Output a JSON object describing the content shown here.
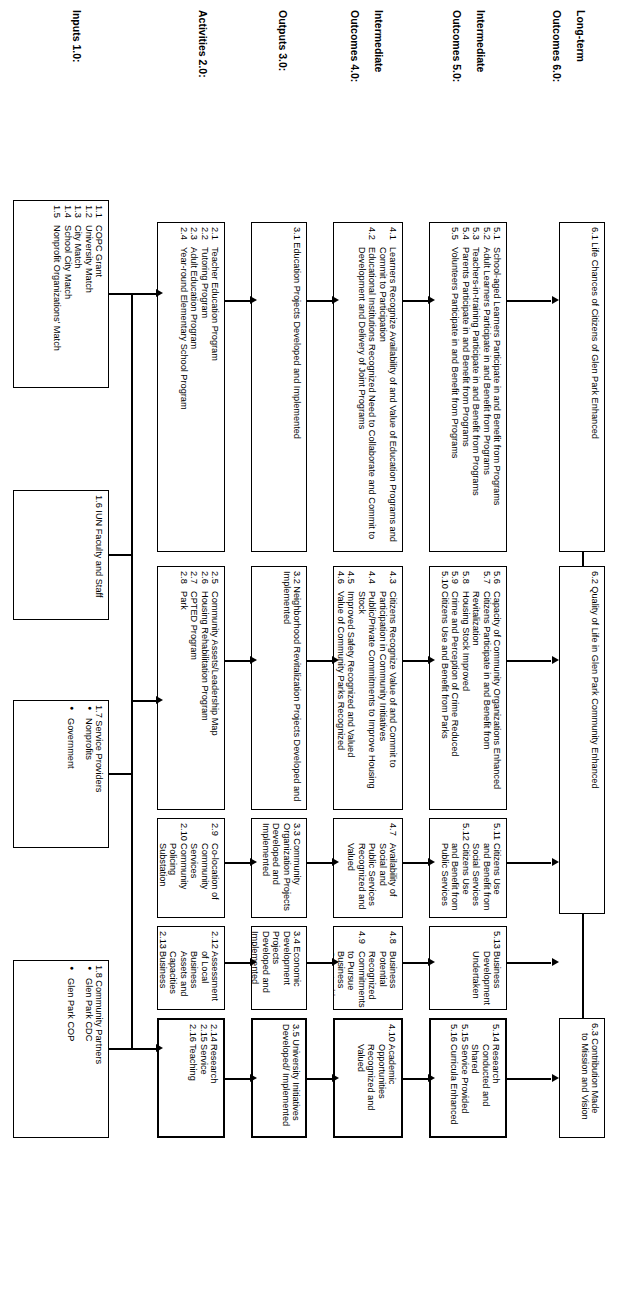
{
  "diagram": {
    "row_labels": [
      {
        "id": "long-term",
        "line1": "Long-term",
        "line2": "Outcomes 6.0:"
      },
      {
        "id": "intermediate-5",
        "line1": "Intermediate",
        "line2": "Outcomes 5.0:"
      },
      {
        "id": "intermediate-4",
        "line1": "Intermediate",
        "line2": "Outcomes 4.0:"
      },
      {
        "id": "outputs",
        "line1": "Outputs 3.0:",
        "line2": ""
      },
      {
        "id": "activities",
        "line1": "Activities 2.0:",
        "line2": ""
      },
      {
        "id": "inputs",
        "line1": "Inputs 1.0:",
        "line2": ""
      }
    ],
    "boxes": {
      "b61": {
        "title": "6.1 Life Chances of Citizens of Glen Park Enhanced"
      },
      "b62": {
        "title": "6.2 Quality of Life in Glen Park Community Enhanced"
      },
      "b63": {
        "title": "6.3 Contribution Made",
        "subtitle": "to Mission and Vision"
      },
      "b51": {
        "items": [
          {
            "num": "5.1",
            "txt": "School-aged Learners Participate in and Benefit from Programs"
          },
          {
            "num": "5.2",
            "txt": "Adult Learners Participate in and Benefit from Programs"
          },
          {
            "num": "5.3",
            "txt": "Teachers-in-training Participate in and Benefit from Programs"
          },
          {
            "num": "5.4",
            "txt": "Parents Participate in and Benefit from Programs"
          },
          {
            "num": "5.5",
            "txt": "Volunteers Participate in and Benefit from Programs"
          }
        ]
      },
      "b56": {
        "items": [
          {
            "num": "5.6",
            "txt": "Capacity of Community Organizations Enhanced"
          },
          {
            "num": "5.7",
            "txt": "Citizens Participate in and Benefit from Revitalization"
          },
          {
            "num": "5.8",
            "txt": "Housing Stock Improved"
          },
          {
            "num": "5.9",
            "txt": "Crime and Perception of Crime Reduced"
          },
          {
            "num": "5.10",
            "txt": "Citizens Use and Benefit from Parks"
          }
        ]
      },
      "b511": {
        "items": [
          {
            "num": "5.11",
            "txt": "Citizens Use and Benefit from Social Services"
          },
          {
            "num": "5.12",
            "txt": "Citizens Use and Benefit from Public Services"
          }
        ]
      },
      "b513": {
        "items": [
          {
            "num": "5.13",
            "txt": "Business Development Undertaken"
          }
        ]
      },
      "b514": {
        "items": [
          {
            "num": "5.14",
            "txt": "Research Conducted and Shared"
          },
          {
            "num": "5.15",
            "txt": "Service Provided"
          },
          {
            "num": "5.16",
            "txt": "Curricula Enhanced"
          }
        ]
      },
      "b41": {
        "items": [
          {
            "num": "4.1",
            "txt": "Learners Recognize Availability of and Value of Education Programs and Commit to Participation"
          },
          {
            "num": "4.2",
            "txt": "Educational Institutions Recognized Need to Collaborate and Commit to Development and Delivery of Joint Programs"
          }
        ]
      },
      "b43": {
        "items": [
          {
            "num": "4.3",
            "txt": "Citizens Recognize Value of and Commit to Participation in Community Initiatives"
          },
          {
            "num": "4.4",
            "txt": "Public/Private Commitments to Improve Housing Stock"
          },
          {
            "num": "4.5",
            "txt": "Improved Safety Recognized and Valued"
          },
          {
            "num": "4.6",
            "txt": "Value of Community Parks Recognized"
          }
        ]
      },
      "b47": {
        "items": [
          {
            "num": "4.7",
            "txt": "Availability of Social and Public Services Recognized and Valued"
          }
        ]
      },
      "b48": {
        "items": [
          {
            "num": "4.8",
            "txt": "Business Potential Recognized"
          },
          {
            "num": "4.9",
            "txt": "Commitments to Pursue Business Opportunities Secured"
          }
        ]
      },
      "b410": {
        "items": [
          {
            "num": "4.10",
            "txt": "Academic Opportunities Recognized and Valued"
          }
        ]
      },
      "b31": {
        "title": "3.1 Education Projects Developed and Implemented"
      },
      "b32": {
        "title": "3.2 Neighborhood Revitalization Projects Developed and Implemented"
      },
      "b33": {
        "title": "3.3 Community Organization Projects Developed and Implemented"
      },
      "b34": {
        "title": "3.4 Economic Development Projects Developed and Implemented"
      },
      "b35": {
        "title": "3.5 University Initiatives Developed/ Implemented"
      },
      "b21": {
        "items": [
          {
            "num": "2.1",
            "txt": "Teacher Education Program"
          },
          {
            "num": "2.2",
            "txt": "Tutoring Program"
          },
          {
            "num": "2.3",
            "txt": "Adult Education Program"
          },
          {
            "num": "2.4",
            "txt": "Year-round Elementary School Program"
          }
        ]
      },
      "b25": {
        "items": [
          {
            "num": "2.5",
            "txt": "Community Assets/Leadership Map"
          },
          {
            "num": "2.6",
            "txt": "Housing Rehabilitation Program"
          },
          {
            "num": "2.7",
            "txt": "CPTED Program"
          },
          {
            "num": "2.8",
            "txt": "Park"
          }
        ]
      },
      "b29": {
        "items": [
          {
            "num": "2.9",
            "txt": "Co-location of Community Services"
          },
          {
            "num": "2.10",
            "txt": "Community Policing Substation"
          },
          {
            "num": "2.11",
            "txt": "City Government Liaison"
          }
        ]
      },
      "b212": {
        "items": [
          {
            "num": "2.12",
            "txt": "Assessment of Local Business Assets and Capacities"
          },
          {
            "num": "2.13",
            "txt": "Business"
          }
        ]
      },
      "b214": {
        "items": [
          {
            "num": "2.14",
            "txt": "Research"
          },
          {
            "num": "2.15",
            "txt": "Service"
          },
          {
            "num": "2.16",
            "txt": "Teaching"
          }
        ]
      },
      "b11": {
        "items": [
          {
            "num": "1.1",
            "txt": "COPC Grant"
          },
          {
            "num": "1.2",
            "txt": "University Match"
          },
          {
            "num": "1.3",
            "txt": "City Match"
          },
          {
            "num": "1.4",
            "txt": "School City Match"
          },
          {
            "num": "1.5",
            "txt": "Nonprofit Organizations' Match"
          }
        ]
      },
      "b16": {
        "title": "1.6 IUN Faculty and Staff"
      },
      "b17": {
        "title": "1.7 Service Providers",
        "bullets": [
          "Nonprofits",
          "Government"
        ]
      },
      "b18": {
        "title": "1.8 Community Partners",
        "bullets": [
          "Glen Park CDC",
          "Glen Park COP"
        ]
      }
    }
  }
}
